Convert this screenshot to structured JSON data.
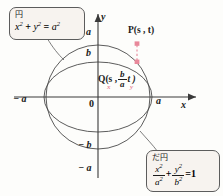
{
  "figure": {
    "background_color": "#fdfdfb",
    "curve_color": "#4a4a4a",
    "axis_color": "#3a3a3a",
    "accent_color": "#e8889a",
    "callout_fill": "#f7f3ef",
    "callout_border": "#5c5c5c"
  },
  "axes": {
    "x_label": "x",
    "y_label": "y",
    "origin_label": "0",
    "x_ticks": [
      {
        "label": "− a",
        "value": -1
      },
      {
        "label": "a",
        "value": 1
      }
    ],
    "y_ticks": [
      {
        "label": "a",
        "value": 1
      },
      {
        "label": "b",
        "value": 0.66
      },
      {
        "label": "− b",
        "value": -0.66
      },
      {
        "label": "− a",
        "value": -1
      }
    ]
  },
  "points": {
    "p": {
      "name": "P",
      "label": "P(s , t)",
      "coord_x": "s",
      "coord_y": "t"
    },
    "q": {
      "name": "Q",
      "label_prefix": "Q(s ,",
      "frac_num": "b",
      "frac_den": "a",
      "label_suffix": "t )",
      "sub_x": "x",
      "sub_y": "y"
    }
  },
  "callouts": {
    "circle": {
      "caption": "円",
      "equation_plain": "x² + y² = a²",
      "terms": {
        "t1_base": "x",
        "t1_exp": "2",
        "plus": "+",
        "t2_base": "y",
        "t2_exp": "2",
        "equals": "=",
        "t3_base": "a",
        "t3_exp": "2"
      }
    },
    "ellipse": {
      "caption": "だ円",
      "equation_plain": "x²/a² + y²/b² = 1",
      "terms": {
        "f1_num_base": "x",
        "f1_num_exp": "2",
        "f1_den_base": "a",
        "f1_den_exp": "2",
        "plus": "+",
        "f2_num_base": "y",
        "f2_num_exp": "2",
        "f2_den_base": "b",
        "f2_den_exp": "2",
        "equals": "=",
        "rhs": "1"
      }
    }
  }
}
